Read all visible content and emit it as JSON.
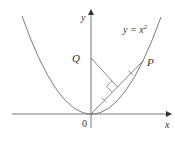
{
  "figure": {
    "curve_label": "y = x",
    "curve_exponent": "2",
    "x_axis_label": "x",
    "y_axis_label": "y",
    "origin_label": "0",
    "point_q_label": "Q",
    "point_p_label": "P"
  },
  "colors": {
    "curve": "#7a7a7a",
    "axes": "#555555",
    "text": "#333333",
    "background": "#ffffff"
  }
}
